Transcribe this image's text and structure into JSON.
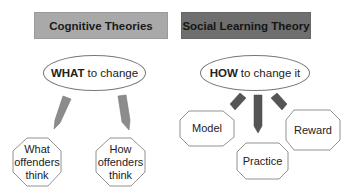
{
  "left_column": {
    "header": "Cognitive Theories",
    "header_color": "#a9a9a9",
    "question_bold": "WHAT",
    "question_rest": "to change",
    "arrow_color": "#8c8c8c",
    "boxes": [
      {
        "line1": "What",
        "line2": "offenders",
        "line3": "think"
      },
      {
        "line1": "How",
        "line2": "offenders",
        "line3": "think"
      }
    ]
  },
  "right_column": {
    "header": "Social Learning Theory",
    "header_color": "#6f6f6f",
    "question_bold": "HOW",
    "question_rest": "to change it",
    "arrow_color": "#555555",
    "boxes": [
      {
        "label": "Model"
      },
      {
        "label": "Practice"
      },
      {
        "label": "Reward"
      }
    ]
  }
}
